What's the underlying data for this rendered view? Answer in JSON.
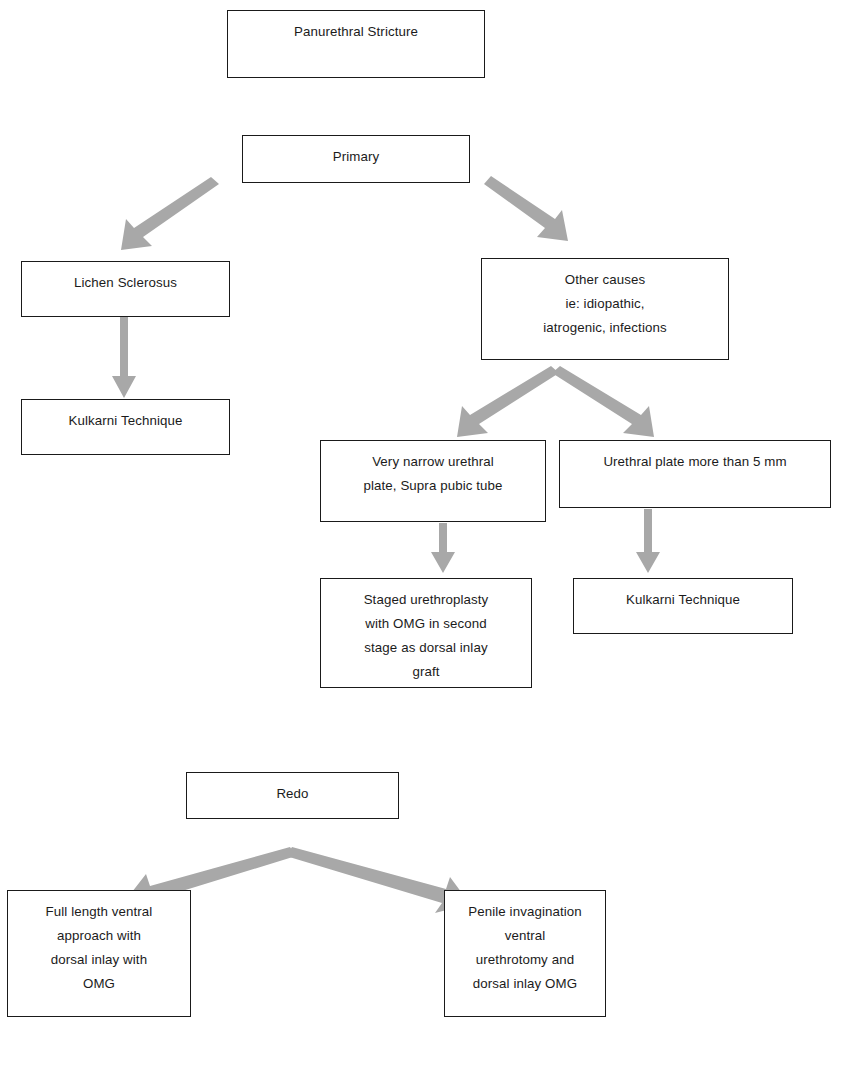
{
  "diagram": {
    "box_border_color": "#1a1a1a",
    "arrow_color": "#a5a5a5",
    "background_color": "#ffffff",
    "nodes": [
      {
        "id": "root",
        "label": "Panurethral Stricture"
      },
      {
        "id": "primary",
        "label": "Primary"
      },
      {
        "id": "lichen",
        "label": "Lichen Sclerosus"
      },
      {
        "id": "kulkarni_left",
        "label": "Kulkarni Technique"
      },
      {
        "id": "other_causes",
        "label": "Other causes\nie: idiopathic,\niatrogenic, infections"
      },
      {
        "id": "very_narrow",
        "label": "Very narrow urethral\nplate, Supra pubic tube"
      },
      {
        "id": "plate_5mm",
        "label": "Urethral plate more than 5 mm"
      },
      {
        "id": "staged",
        "label": "Staged urethroplasty\nwith OMG in second\nstage as dorsal inlay\ngraft"
      },
      {
        "id": "kulkarni_right",
        "label": "Kulkarni Technique"
      },
      {
        "id": "redo",
        "label": "Redo"
      },
      {
        "id": "full_length",
        "label": "Full length ventral\napproach with\ndorsal inlay with\nOMG"
      },
      {
        "id": "penile",
        "label": "Penile invagination\nventral\nurethrotomy and\ndorsal inlay OMG"
      }
    ],
    "edges": [
      {
        "from": "primary",
        "to": "lichen",
        "style": "diagonal-left"
      },
      {
        "from": "primary",
        "to": "other_causes",
        "style": "diagonal-right"
      },
      {
        "from": "lichen",
        "to": "kulkarni_left",
        "style": "vertical"
      },
      {
        "from": "other_causes",
        "to": "very_narrow",
        "style": "diagonal-left"
      },
      {
        "from": "other_causes",
        "to": "plate_5mm",
        "style": "diagonal-right"
      },
      {
        "from": "very_narrow",
        "to": "staged",
        "style": "vertical"
      },
      {
        "from": "plate_5mm",
        "to": "kulkarni_right",
        "style": "vertical"
      },
      {
        "from": "redo",
        "to": "full_length",
        "style": "diagonal-left"
      },
      {
        "from": "redo",
        "to": "penile",
        "style": "diagonal-right"
      }
    ]
  }
}
